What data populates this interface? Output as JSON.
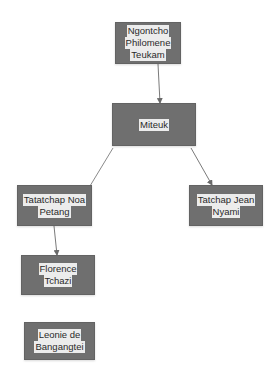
{
  "diagram": {
    "type": "family-tree",
    "colors": {
      "node_fill": "#6f6f6f",
      "text_highlight": "#ececec",
      "text": "#2a2a2a",
      "connector": "#7a7a7a"
    },
    "nodes": [
      {
        "id": "ngontcho",
        "lines": [
          "Ngontcho",
          "Philomene",
          "Teukam"
        ],
        "x": 115,
        "y": 22,
        "w": 66,
        "h": 42
      },
      {
        "id": "miteuk",
        "lines": [
          "Miteuk"
        ],
        "x": 112,
        "y": 103,
        "w": 84,
        "h": 43
      },
      {
        "id": "tatatchap-noa",
        "lines": [
          "Tatatchap Noa",
          "Petang"
        ],
        "x": 17,
        "y": 185,
        "w": 75,
        "h": 41
      },
      {
        "id": "tatchap-jean",
        "lines": [
          "Tatchap Jean",
          "Nyami"
        ],
        "x": 189,
        "y": 185,
        "w": 74,
        "h": 41
      },
      {
        "id": "florence",
        "lines": [
          "Florence",
          "Tchazi"
        ],
        "x": 21,
        "y": 255,
        "w": 74,
        "h": 40
      },
      {
        "id": "leonie",
        "lines": [
          "Leonie de",
          "Bangangtei"
        ],
        "x": 24,
        "y": 322,
        "w": 71,
        "h": 38
      }
    ],
    "edges": [
      {
        "from": "ngontcho",
        "to": "miteuk",
        "x1": 158,
        "y1": 64,
        "x2": 160,
        "y2": 103,
        "arrow": true
      },
      {
        "from": "miteuk",
        "to": "tatatchap-noa",
        "x1": 113,
        "y1": 148,
        "x2": 90,
        "y2": 186,
        "arrow": false
      },
      {
        "from": "miteuk",
        "to": "tatchap-jean",
        "x1": 191,
        "y1": 148,
        "x2": 212,
        "y2": 185,
        "arrow": true
      },
      {
        "from": "tatatchap-noa",
        "to": "florence",
        "x1": 54,
        "y1": 226,
        "x2": 57,
        "y2": 255,
        "arrow": true
      }
    ]
  }
}
